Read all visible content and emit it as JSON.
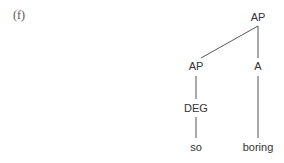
{
  "example": {
    "label": "(f)"
  },
  "tree": {
    "nodes": {
      "root": {
        "label": "AP",
        "x": 258,
        "y": 17
      },
      "ap": {
        "label": "AP",
        "x": 196,
        "y": 66
      },
      "a": {
        "label": "A",
        "x": 258,
        "y": 66
      },
      "deg": {
        "label": "DEG",
        "x": 196,
        "y": 108
      },
      "so": {
        "label": "so",
        "x": 196,
        "y": 147
      },
      "boring": {
        "label": "boring",
        "x": 258,
        "y": 147
      }
    },
    "edges": [
      {
        "from": "root",
        "to": "ap"
      },
      {
        "from": "root",
        "to": "a"
      },
      {
        "from": "ap",
        "to": "deg"
      },
      {
        "from": "deg",
        "to": "so"
      },
      {
        "from": "a",
        "to": "boring"
      }
    ],
    "colors": {
      "text": "#333333",
      "line": "#555555"
    }
  }
}
